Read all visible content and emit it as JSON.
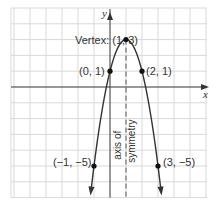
{
  "chart_data": {
    "type": "line",
    "title": "",
    "equation": "y = -2x^2 + 4x + 1",
    "xlabel": "x",
    "ylabel": "y",
    "xlim": [
      -6,
      6
    ],
    "ylim": [
      -7,
      5
    ],
    "grid": true,
    "series": [
      {
        "name": "parabola",
        "x": [
          -1.2,
          -1,
          0,
          1,
          2,
          3,
          3.2
        ],
        "y": [
          -6.7,
          -5,
          1,
          3,
          1,
          -5,
          -6.7
        ]
      }
    ],
    "points": [
      {
        "x": 1,
        "y": 3,
        "label": "(1, 3)",
        "prefix": "Vertex:"
      },
      {
        "x": 0,
        "y": 1,
        "label": "(0, 1)"
      },
      {
        "x": 2,
        "y": 1,
        "label": "(2, 1)"
      },
      {
        "x": -1,
        "y": -5,
        "label": "(−1, −5)"
      },
      {
        "x": 3,
        "y": -5,
        "label": "(3, −5)"
      }
    ],
    "annotations": {
      "axis_of_symmetry": {
        "x": 1,
        "line1": "axis of",
        "line2": "symmetry"
      },
      "vertex_label": "Vertex: (1, 3)"
    }
  },
  "labels": {
    "x_axis": "x",
    "y_axis": "y",
    "vertex": "Vertex: (1, 3)",
    "p01": "(0, 1)",
    "p21": "(2, 1)",
    "pm1m5": "(−1, −5)",
    "p3m5": "(3, −5)",
    "axis_line1": "axis of",
    "axis_line2": "symmetry"
  },
  "colors": {
    "grid": "#d9d9d9",
    "axis": "#333333",
    "curve": "#333333",
    "points": "#111111"
  }
}
